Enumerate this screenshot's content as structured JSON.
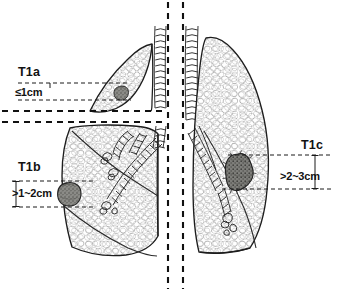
{
  "figure": {
    "background_color": "#ffffff",
    "ink_color": "#1a1a1a",
    "tumor_fill_color": "#8a8a86",
    "width": 340,
    "height": 291
  },
  "stages": [
    {
      "id": "t1a",
      "label": "T1a",
      "size_label": "≤1cm",
      "panel": "upper-left",
      "tumor": {
        "shape": "small-round-nodule",
        "cx": 121,
        "cy": 93,
        "r": 7.2
      },
      "caliper": {
        "top_y": 83,
        "bottom_y": 100,
        "x_start": 18,
        "x_end": 130
      }
    },
    {
      "id": "t1b",
      "label": "T1b",
      "size_label": ">1~2cm",
      "panel": "lower-left",
      "tumor": {
        "shape": "round-nodule",
        "cx": 69,
        "cy": 194,
        "r": 11.5
      },
      "caliper": {
        "top_y": 181,
        "bottom_y": 207,
        "x_start": 12,
        "x_end": 95
      }
    },
    {
      "id": "t1c",
      "label": "T1c",
      "size_label": ">2~3cm",
      "panel": "right",
      "tumor": {
        "shape": "irregular-spiculated-mass",
        "cx": 239,
        "cy": 172,
        "r": 17
      },
      "caliper": {
        "top_y": 155,
        "bottom_y": 189,
        "x_start": 228,
        "x_end": 332
      }
    }
  ],
  "anatomy": {
    "left_panel_upper": "left lung upper view with small peripheral nodule",
    "left_panel_lower": "left lung with bronchial tree and nodule",
    "right_panel": "right lung with central spiculated mass",
    "trachea": "tracheal cartilage rings at midline",
    "bronchi": "segmental bronchi with cartilage rings"
  },
  "dividers": {
    "vertical_left_x": 168,
    "vertical_right_x": 183,
    "horizontal_upper_y": 111,
    "horizontal_lower_y": 122
  }
}
